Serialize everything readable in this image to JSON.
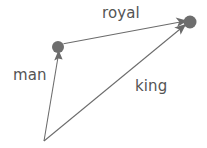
{
  "diagram": {
    "background_color": "#ffffff",
    "node_color": "#6e6e6e",
    "edge_color": "#6b6b6b",
    "label_color": "#545454",
    "nodes": [
      {
        "id": "origin",
        "label": "",
        "x": 44,
        "y": 141,
        "visible_dot": false
      },
      {
        "id": "man",
        "label": "",
        "x": 58,
        "y": 47,
        "visible_dot": true,
        "radius": 6
      },
      {
        "id": "king",
        "label": "",
        "x": 190,
        "y": 22,
        "visible_dot": true,
        "radius": 6.5
      }
    ],
    "edges": [
      {
        "id": "man",
        "label": "man",
        "from": "origin",
        "to": "man",
        "x1": 44,
        "y1": 141,
        "x2": 58,
        "y2": 53,
        "arrow": "end"
      },
      {
        "id": "king",
        "label": "king",
        "from": "origin",
        "to": "king",
        "x1": 44,
        "y1": 141,
        "x2": 184,
        "y2": 26,
        "arrow": "end"
      },
      {
        "id": "royal",
        "label": "royal",
        "from": "man",
        "to": "king",
        "x1": 64,
        "y1": 44,
        "x2": 184,
        "y2": 22,
        "arrow": "end"
      }
    ],
    "labels": {
      "royal": "royal",
      "man": "man",
      "king": "king"
    }
  }
}
